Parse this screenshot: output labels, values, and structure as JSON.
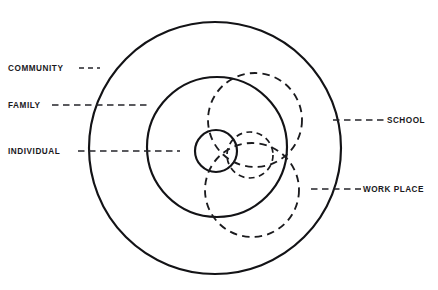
{
  "diagram": {
    "type": "concentric-venn",
    "title_clipped": "",
    "background_color": "#ffffff",
    "line_color": "#131316",
    "canvas": {
      "width": 438,
      "height": 290
    },
    "solid_circles": [
      {
        "id": "community",
        "label": "COMMUNITY",
        "style": "solid",
        "cx": 215,
        "cy": 148,
        "r": 126
      },
      {
        "id": "family",
        "label": "FAMILY",
        "style": "solid",
        "cx": 217,
        "cy": 147,
        "r": 70
      },
      {
        "id": "individual",
        "label": "INDIVIDUAL",
        "style": "solid",
        "cx": 216,
        "cy": 151,
        "r": 21
      }
    ],
    "dashed_circles": [
      {
        "id": "school",
        "label": "SCHOOL",
        "style": "dashed",
        "cx": 255,
        "cy": 120,
        "r": 47
      },
      {
        "id": "work-place",
        "label": "WORK PLACE",
        "style": "dashed",
        "cx": 252,
        "cy": 190,
        "r": 47
      },
      {
        "id": "middle-overlap",
        "label": "",
        "style": "dashed",
        "cx": 250,
        "cy": 155,
        "r": 23
      }
    ],
    "left_labels": [
      {
        "id": "community",
        "text": "COMMUNITY",
        "text_x": 8,
        "text_y": 71,
        "leader_x1": 79,
        "leader_x2": 100,
        "leader_y": 68
      },
      {
        "id": "family",
        "text": "FAMILY",
        "text_x": 8,
        "text_y": 108,
        "leader_x1": 52,
        "leader_x2": 148,
        "leader_y": 105
      },
      {
        "id": "individual",
        "text": "INDIVIDUAL",
        "text_x": 8,
        "text_y": 154,
        "leader_x1": 78,
        "leader_x2": 180,
        "leader_y": 151
      }
    ],
    "right_labels": [
      {
        "id": "school",
        "text": "SCHOOL",
        "text_x": 387,
        "text_y": 123,
        "leader_x1": 333,
        "leader_x2": 385,
        "leader_y": 120
      },
      {
        "id": "work-place",
        "text": "WORK PLACE",
        "text_x": 363,
        "text_y": 192,
        "leader_x1": 311,
        "leader_x2": 361,
        "leader_y": 189
      }
    ]
  }
}
